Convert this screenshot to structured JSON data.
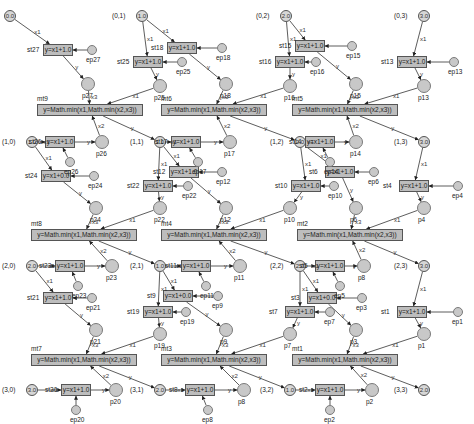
{
  "diagram": {
    "type": "petri-net",
    "grid_cells": [
      {
        "id": "c00",
        "label": "(0,0)",
        "value": "0.0",
        "x": 10,
        "y": 16
      },
      {
        "id": "c01",
        "label": "(0,1)",
        "value": "1.0",
        "x": 142,
        "y": 16
      },
      {
        "id": "c02",
        "label": "(0,2)",
        "value": "2.0",
        "x": 286,
        "y": 16
      },
      {
        "id": "c03",
        "label": "(0,3)",
        "value": "3.0",
        "x": 424,
        "y": 16
      },
      {
        "id": "c10",
        "label": "(1,0)",
        "value": "1.0",
        "x": 32,
        "y": 142
      },
      {
        "id": "c11",
        "label": "(1,1)",
        "value": "1.0",
        "x": 160,
        "y": 142
      },
      {
        "id": "c12",
        "label": "(1,2)",
        "value": "2.0",
        "x": 300,
        "y": 142
      },
      {
        "id": "c13",
        "label": "(1,3)",
        "value": "3.0",
        "x": 424,
        "y": 142
      },
      {
        "id": "c20",
        "label": "(2,0)",
        "value": "2.0",
        "x": 32,
        "y": 266
      },
      {
        "id": "c21",
        "label": "(2,1)",
        "value": "1.0",
        "x": 160,
        "y": 266
      },
      {
        "id": "c22",
        "label": "(2,2)",
        "value": "2.0",
        "x": 300,
        "y": 266
      },
      {
        "id": "c23",
        "label": "(2,3)",
        "value": "3.0",
        "x": 424,
        "y": 266
      },
      {
        "id": "c30",
        "label": "(3,0)",
        "value": "3.0",
        "x": 32,
        "y": 390
      },
      {
        "id": "c31",
        "label": "(3,1)",
        "value": "2.0",
        "x": 160,
        "y": 390
      },
      {
        "id": "c32",
        "label": "(3,2)",
        "value": "1.0",
        "x": 290,
        "y": 390
      },
      {
        "id": "c33",
        "label": "(3,3)",
        "value": "2.0",
        "x": 424,
        "y": 390
      }
    ],
    "step_transitions": [
      {
        "id": "st27",
        "label": "st27",
        "formula": "y=x1+1.0",
        "x": 58,
        "y": 50,
        "w": 30
      },
      {
        "id": "st25",
        "label": "st25",
        "formula": "y=x1+1.0",
        "x": 148,
        "y": 62,
        "w": 30
      },
      {
        "id": "st18",
        "label": "st18",
        "formula": "y=x1+1.0",
        "x": 182,
        "y": 48,
        "w": 30
      },
      {
        "id": "st16",
        "label": "st16",
        "formula": "y=x1+1.0",
        "x": 290,
        "y": 62,
        "w": 30
      },
      {
        "id": "st15",
        "label": "st15",
        "formula": "y=x1+1.0",
        "x": 310,
        "y": 46,
        "w": 30
      },
      {
        "id": "st13",
        "label": "st13",
        "formula": "y=x1+1.0",
        "x": 412,
        "y": 62,
        "w": 30
      },
      {
        "id": "st26",
        "label": "st26",
        "formula": "y=x1+1.0",
        "x": 60,
        "y": 142,
        "w": 30
      },
      {
        "id": "st24",
        "label": "st24",
        "formula": "y=x1+0.0",
        "x": 56,
        "y": 176,
        "w": 30
      },
      {
        "id": "st17",
        "label": "st17",
        "formula": "y=x1+1.0",
        "x": 186,
        "y": 142,
        "w": 30
      },
      {
        "id": "st22",
        "label": "st22",
        "formula": "y=x1+1.0",
        "x": 158,
        "y": 186,
        "w": 30
      },
      {
        "id": "st12",
        "label": "st12",
        "formula": "y=x1+1.0",
        "x": 184,
        "y": 172,
        "w": 30
      },
      {
        "id": "st14",
        "label": "st14",
        "formula": "y=x1+1.0",
        "x": 320,
        "y": 142,
        "w": 30
      },
      {
        "id": "st10",
        "label": "st10",
        "formula": "y=x1+1.0",
        "x": 306,
        "y": 186,
        "w": 30
      },
      {
        "id": "st6",
        "label": "st6",
        "formula": "y=x1+1.0",
        "x": 340,
        "y": 172,
        "w": 30
      },
      {
        "id": "st4",
        "label": "st4",
        "formula": "y=x1+1.0",
        "x": 414,
        "y": 186,
        "w": 30
      },
      {
        "id": "st23",
        "label": "st23",
        "formula": "y=x1+1.0",
        "x": 70,
        "y": 266,
        "w": 30
      },
      {
        "id": "st21",
        "label": "st21",
        "formula": "y=x1+1.0",
        "x": 58,
        "y": 298,
        "w": 30
      },
      {
        "id": "st11",
        "label": "st11",
        "formula": "y=x1+1.0",
        "x": 196,
        "y": 266,
        "w": 30
      },
      {
        "id": "st9",
        "label": "st9",
        "formula": "y=x1+0.0",
        "x": 178,
        "y": 296,
        "w": 30
      },
      {
        "id": "st19",
        "label": "st19",
        "formula": "y=x1+1.0",
        "x": 158,
        "y": 312,
        "w": 30
      },
      {
        "id": "st7",
        "label": "st7",
        "formula": "y=x1+1.0",
        "x": 300,
        "y": 312,
        "w": 30
      },
      {
        "id": "st5",
        "label": "st5",
        "formula": "y=x1+1.0",
        "x": 330,
        "y": 266,
        "w": 30
      },
      {
        "id": "st3",
        "label": "st3",
        "formula": "y=x1+0.0",
        "x": 322,
        "y": 298,
        "w": 30
      },
      {
        "id": "st1",
        "label": "st1",
        "formula": "y=x1+1.0",
        "x": 412,
        "y": 312,
        "w": 30
      },
      {
        "id": "st20",
        "label": "st20",
        "formula": "y=x1+1.0",
        "x": 76,
        "y": 390,
        "w": 30
      },
      {
        "id": "st8",
        "label": "st8",
        "formula": "y=x1+1.0",
        "x": 200,
        "y": 390,
        "w": 30
      },
      {
        "id": "st2",
        "label": "st2",
        "formula": "y=x1+1.0",
        "x": 330,
        "y": 390,
        "w": 30
      }
    ],
    "min_transitions": [
      {
        "id": "mt9",
        "label": "mt9",
        "formula": "y=Math.min(x1,Math.min(x2,x3))",
        "x": 90,
        "y": 110,
        "w": 106
      },
      {
        "id": "mt6",
        "label": "mt6",
        "formula": "y=Math.min(x1,Math.min(x2,x3))",
        "x": 214,
        "y": 110,
        "w": 106
      },
      {
        "id": "mt5",
        "label": "mt5",
        "formula": "y=Math.min(x1,Math.min(x2,x3))",
        "x": 345,
        "y": 110,
        "w": 106
      },
      {
        "id": "mt8",
        "label": "mt8",
        "formula": "y=Math.min(x1,Math.min(x2,x3))",
        "x": 84,
        "y": 235,
        "w": 106
      },
      {
        "id": "mt4",
        "label": "mt4",
        "formula": "y=Math.min(x1,Math.min(x2,x3))",
        "x": 214,
        "y": 235,
        "w": 106
      },
      {
        "id": "mt2",
        "label": "mt2",
        "formula": "y=Math.min(x1,Math.min(x2,x3))",
        "x": 350,
        "y": 235,
        "w": 106
      },
      {
        "id": "mt7",
        "label": "mt7",
        "formula": "y=Math.min(x1,Math.min(x2,x3))",
        "x": 84,
        "y": 360,
        "w": 106
      },
      {
        "id": "mt3",
        "label": "mt3",
        "formula": "y=Math.min(x1,Math.min(x2,x3))",
        "x": 214,
        "y": 360,
        "w": 106
      },
      {
        "id": "mt1",
        "label": "mt1",
        "formula": "y=Math.min(x1,Math.min(x2,x3))",
        "x": 345,
        "y": 360,
        "w": 106
      }
    ],
    "intermediate_places": [
      {
        "id": "p27",
        "label": "p27",
        "x": 88,
        "y": 84
      },
      {
        "id": "p25",
        "label": "p25",
        "x": 160,
        "y": 86
      },
      {
        "id": "p18",
        "label": "p18",
        "x": 226,
        "y": 84
      },
      {
        "id": "p16",
        "label": "p16",
        "x": 290,
        "y": 86
      },
      {
        "id": "p15",
        "label": "p15",
        "x": 356,
        "y": 84
      },
      {
        "id": "p13",
        "label": "p13",
        "x": 424,
        "y": 86
      },
      {
        "id": "p26",
        "label": "p26",
        "x": 102,
        "y": 142
      },
      {
        "id": "p17",
        "label": "p17",
        "x": 230,
        "y": 142
      },
      {
        "id": "p14",
        "label": "p14",
        "x": 356,
        "y": 142
      },
      {
        "id": "p24",
        "label": "p24",
        "x": 96,
        "y": 208
      },
      {
        "id": "p22",
        "label": "p22",
        "x": 160,
        "y": 208
      },
      {
        "id": "p12",
        "label": "p12",
        "x": 226,
        "y": 208
      },
      {
        "id": "p10",
        "label": "p10",
        "x": 290,
        "y": 208
      },
      {
        "id": "p6",
        "label": "p6",
        "x": 356,
        "y": 208
      },
      {
        "id": "p4",
        "label": "p4",
        "x": 424,
        "y": 208
      },
      {
        "id": "p23",
        "label": "p23",
        "x": 112,
        "y": 266
      },
      {
        "id": "p11",
        "label": "p11",
        "x": 240,
        "y": 266
      },
      {
        "id": "p8",
        "label": "p8",
        "x": 364,
        "y": 266
      },
      {
        "id": "p21",
        "label": "p21",
        "x": 96,
        "y": 330
      },
      {
        "id": "p19",
        "label": "p19",
        "x": 160,
        "y": 334
      },
      {
        "id": "p9",
        "label": "p9",
        "x": 226,
        "y": 330
      },
      {
        "id": "p7",
        "label": "p7",
        "x": 290,
        "y": 334
      },
      {
        "id": "p3",
        "label": "p3",
        "x": 356,
        "y": 330
      },
      {
        "id": "p1",
        "label": "p1",
        "x": 424,
        "y": 334
      },
      {
        "id": "p20",
        "label": "p20",
        "x": 116,
        "y": 390
      },
      {
        "id": "p8b",
        "label": "p8",
        "x": 244,
        "y": 390
      },
      {
        "id": "p2",
        "label": "p2",
        "x": 372,
        "y": 390
      }
    ],
    "external_places": [
      {
        "id": "ep27",
        "label": "ep27",
        "x": 92,
        "y": 50
      },
      {
        "id": "ep25",
        "label": "ep25",
        "x": 182,
        "y": 62
      },
      {
        "id": "ep18",
        "label": "ep18",
        "x": 222,
        "y": 48
      },
      {
        "id": "ep16",
        "label": "ep16",
        "x": 316,
        "y": 62
      },
      {
        "id": "ep15",
        "label": "ep15",
        "x": 352,
        "y": 46
      },
      {
        "id": "ep13",
        "label": "ep13",
        "x": 454,
        "y": 62
      },
      {
        "id": "ep26",
        "label": "ep26",
        "x": 70,
        "y": 162
      },
      {
        "id": "ep24",
        "label": "ep24",
        "x": 94,
        "y": 176
      },
      {
        "id": "ep17",
        "label": "ep17",
        "x": 198,
        "y": 162
      },
      {
        "id": "ep22",
        "label": "ep22",
        "x": 188,
        "y": 186
      },
      {
        "id": "ep12",
        "label": "ep12",
        "x": 222,
        "y": 172
      },
      {
        "id": "ep14",
        "label": "ep14",
        "x": 330,
        "y": 162
      },
      {
        "id": "ep10",
        "label": "ep10",
        "x": 334,
        "y": 186
      },
      {
        "id": "ep6",
        "label": "ep6",
        "x": 374,
        "y": 172
      },
      {
        "id": "ep4",
        "label": "ep4",
        "x": 458,
        "y": 186
      },
      {
        "id": "ep23",
        "label": "ep23",
        "x": 78,
        "y": 286
      },
      {
        "id": "ep21",
        "label": "ep21",
        "x": 92,
        "y": 298
      },
      {
        "id": "ep11",
        "label": "ep11",
        "x": 206,
        "y": 286
      },
      {
        "id": "ep9",
        "label": "ep9",
        "x": 218,
        "y": 296
      },
      {
        "id": "ep19",
        "label": "ep19",
        "x": 186,
        "y": 312
      },
      {
        "id": "ep7",
        "label": "ep7",
        "x": 330,
        "y": 312
      },
      {
        "id": "ep5",
        "label": "ep5",
        "x": 340,
        "y": 286
      },
      {
        "id": "ep3",
        "label": "ep3",
        "x": 362,
        "y": 298
      },
      {
        "id": "ep1",
        "label": "ep1",
        "x": 458,
        "y": 312
      },
      {
        "id": "ep20",
        "label": "ep20",
        "x": 76,
        "y": 410
      },
      {
        "id": "ep8",
        "label": "ep8",
        "x": 208,
        "y": 410
      },
      {
        "id": "ep2",
        "label": "ep2",
        "x": 330,
        "y": 410
      }
    ],
    "edges": [
      [
        "c00",
        "st27",
        "x1"
      ],
      [
        "st27",
        "p27",
        "y"
      ],
      [
        "ep27",
        "st27",
        ""
      ],
      [
        "p27",
        "mt9",
        "x3"
      ],
      [
        "c01",
        "st25",
        "x1"
      ],
      [
        "st25",
        "p25",
        "y"
      ],
      [
        "ep25",
        "st25",
        ""
      ],
      [
        "p25",
        "mt9",
        "x1"
      ],
      [
        "c01",
        "st18",
        "x1"
      ],
      [
        "st18",
        "p18",
        "y"
      ],
      [
        "ep18",
        "st18",
        ""
      ],
      [
        "p18",
        "mt6",
        "x3"
      ],
      [
        "c02",
        "st16",
        "x1"
      ],
      [
        "st16",
        "p16",
        "y"
      ],
      [
        "ep16",
        "st16",
        ""
      ],
      [
        "p16",
        "mt6",
        "x1"
      ],
      [
        "c02",
        "st15",
        "x1"
      ],
      [
        "st15",
        "p15",
        "y"
      ],
      [
        "ep15",
        "st15",
        ""
      ],
      [
        "p15",
        "mt5",
        "x3"
      ],
      [
        "c03",
        "st13",
        "x1"
      ],
      [
        "st13",
        "p13",
        "y"
      ],
      [
        "ep13",
        "st13",
        ""
      ],
      [
        "p13",
        "mt5",
        "x1"
      ],
      [
        "mt9",
        "c11",
        "y"
      ],
      [
        "mt6",
        "c12",
        "y"
      ],
      [
        "mt5",
        "c13",
        "y"
      ],
      [
        "c10",
        "st26",
        "x1"
      ],
      [
        "st26",
        "p26",
        "y"
      ],
      [
        "ep26",
        "st26",
        ""
      ],
      [
        "p26",
        "mt9",
        "x2"
      ],
      [
        "c11",
        "st17",
        "x1"
      ],
      [
        "st17",
        "p17",
        "y"
      ],
      [
        "ep17",
        "st17",
        ""
      ],
      [
        "p17",
        "mt6",
        "x2"
      ],
      [
        "c12",
        "st14",
        "x1"
      ],
      [
        "st14",
        "p14",
        "y"
      ],
      [
        "ep14",
        "st14",
        ""
      ],
      [
        "p14",
        "mt5",
        "x2"
      ],
      [
        "c10",
        "st24",
        "x1"
      ],
      [
        "st24",
        "p24",
        "y"
      ],
      [
        "ep24",
        "st24",
        ""
      ],
      [
        "p24",
        "mt8",
        "x3"
      ],
      [
        "c11",
        "st22",
        "x1"
      ],
      [
        "st22",
        "p22",
        "y"
      ],
      [
        "ep22",
        "st22",
        ""
      ],
      [
        "p22",
        "mt8",
        "x1"
      ],
      [
        "c11",
        "st12",
        "x1"
      ],
      [
        "st12",
        "p12",
        "y"
      ],
      [
        "ep12",
        "st12",
        ""
      ],
      [
        "p12",
        "mt4",
        "x3"
      ],
      [
        "c12",
        "st10",
        "x1"
      ],
      [
        "st10",
        "p10",
        "y"
      ],
      [
        "ep10",
        "st10",
        ""
      ],
      [
        "p10",
        "mt4",
        "x1"
      ],
      [
        "c12",
        "st6",
        "x1"
      ],
      [
        "st6",
        "p6",
        "y"
      ],
      [
        "ep6",
        "st6",
        ""
      ],
      [
        "p6",
        "mt2",
        "x3"
      ],
      [
        "c13",
        "st4",
        "x1"
      ],
      [
        "st4",
        "p4",
        "y"
      ],
      [
        "ep4",
        "st4",
        ""
      ],
      [
        "p4",
        "mt2",
        "x1"
      ],
      [
        "mt8",
        "c21",
        "y"
      ],
      [
        "mt4",
        "c22",
        "y"
      ],
      [
        "mt2",
        "c23",
        "y"
      ],
      [
        "c20",
        "st23",
        "x1"
      ],
      [
        "st23",
        "p23",
        "y"
      ],
      [
        "ep23",
        "st23",
        ""
      ],
      [
        "p23",
        "mt8",
        "x2"
      ],
      [
        "c21",
        "st11",
        "x1"
      ],
      [
        "st11",
        "p11",
        "y"
      ],
      [
        "ep11",
        "st11",
        ""
      ],
      [
        "p11",
        "mt4",
        "x2"
      ],
      [
        "c22",
        "st5",
        "x1"
      ],
      [
        "st5",
        "p8",
        "y"
      ],
      [
        "ep5",
        "st5",
        ""
      ],
      [
        "p8",
        "mt2",
        "x2"
      ],
      [
        "c20",
        "st21",
        "x1"
      ],
      [
        "st21",
        "p21",
        "y"
      ],
      [
        "ep21",
        "st21",
        ""
      ],
      [
        "p21",
        "mt7",
        "x3"
      ],
      [
        "c21",
        "st19",
        "x1"
      ],
      [
        "st19",
        "p19",
        "y"
      ],
      [
        "ep19",
        "st19",
        ""
      ],
      [
        "p19",
        "mt7",
        "x1"
      ],
      [
        "c21",
        "st9",
        "x1"
      ],
      [
        "st9",
        "p9",
        "y"
      ],
      [
        "ep9",
        "st9",
        ""
      ],
      [
        "p9",
        "mt3",
        "x3"
      ],
      [
        "c22",
        "st7",
        "x1"
      ],
      [
        "st7",
        "p7",
        "y"
      ],
      [
        "ep7",
        "st7",
        ""
      ],
      [
        "p7",
        "mt3",
        "x1"
      ],
      [
        "c22",
        "st3",
        "x1"
      ],
      [
        "st3",
        "p3",
        "y"
      ],
      [
        "ep3",
        "st3",
        ""
      ],
      [
        "p3",
        "mt1",
        "x3"
      ],
      [
        "c23",
        "st1",
        "x1"
      ],
      [
        "st1",
        "p1",
        "y"
      ],
      [
        "ep1",
        "st1",
        ""
      ],
      [
        "p1",
        "mt1",
        "x1"
      ],
      [
        "mt7",
        "c31",
        "y"
      ],
      [
        "mt3",
        "c32",
        "y"
      ],
      [
        "mt1",
        "c33",
        "y"
      ],
      [
        "c30",
        "st20",
        "x1"
      ],
      [
        "st20",
        "p20",
        "y"
      ],
      [
        "ep20",
        "st20",
        ""
      ],
      [
        "p20",
        "mt7",
        "x2"
      ],
      [
        "c31",
        "st8",
        "x1"
      ],
      [
        "st8",
        "p8b",
        "y"
      ],
      [
        "ep8",
        "st8",
        ""
      ],
      [
        "p8b",
        "mt3",
        "x2"
      ],
      [
        "c32",
        "st2",
        "x1"
      ],
      [
        "st2",
        "p2",
        "y"
      ],
      [
        "ep2",
        "st2",
        ""
      ],
      [
        "p2",
        "mt1",
        "x2"
      ]
    ]
  },
  "colors": {
    "place_fill": "#c8c8c8",
    "transition_fill": "#bdbdbd",
    "edge": "#333333"
  }
}
